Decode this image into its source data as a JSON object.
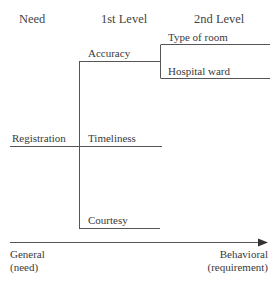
{
  "headers": {
    "need": "Need",
    "level1": "1st Level",
    "level2": "2nd Level"
  },
  "need": "Registration",
  "level1_items": [
    "Accuracy",
    "Timeliness",
    "Courtesy"
  ],
  "level2_items": [
    "Type of room",
    "Hospital ward"
  ],
  "axis": {
    "left_line1": "General",
    "left_line2": "(need)",
    "right_line1": "Behavioral",
    "right_line2": "(requirement)"
  }
}
